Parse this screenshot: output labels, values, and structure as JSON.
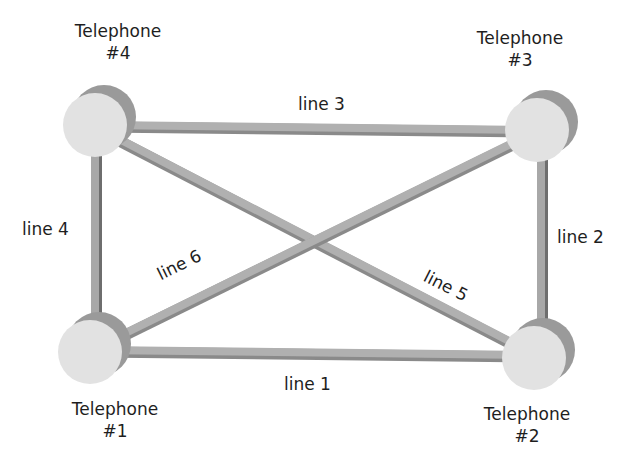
{
  "diagram": {
    "type": "network-topology",
    "colors": {
      "background": "#ffffff",
      "line": "#a8a8a8",
      "line_shadow": "#6e6e6e",
      "node_face": "#e2e2e2",
      "node_side": "#9a9a9a",
      "text": "#1e1e1e"
    },
    "nodes": [
      {
        "id": "tel1",
        "title": "Telephone",
        "number": "#1",
        "cx": 90,
        "cy": 352
      },
      {
        "id": "tel2",
        "title": "Telephone",
        "number": "#2",
        "cx": 534,
        "cy": 358
      },
      {
        "id": "tel3",
        "title": "Telephone",
        "number": "#3",
        "cx": 537,
        "cy": 130
      },
      {
        "id": "tel4",
        "title": "Telephone",
        "number": "#4",
        "cx": 95,
        "cy": 125
      }
    ],
    "edges": [
      {
        "label": "line 1",
        "from": "tel1",
        "to": "tel2"
      },
      {
        "label": "line 2",
        "from": "tel2",
        "to": "tel3"
      },
      {
        "label": "line 3",
        "from": "tel3",
        "to": "tel4"
      },
      {
        "label": "line 4",
        "from": "tel4",
        "to": "tel1"
      },
      {
        "label": "line 5",
        "from": "tel4",
        "to": "tel2"
      },
      {
        "label": "line 6",
        "from": "tel1",
        "to": "tel3"
      }
    ]
  }
}
